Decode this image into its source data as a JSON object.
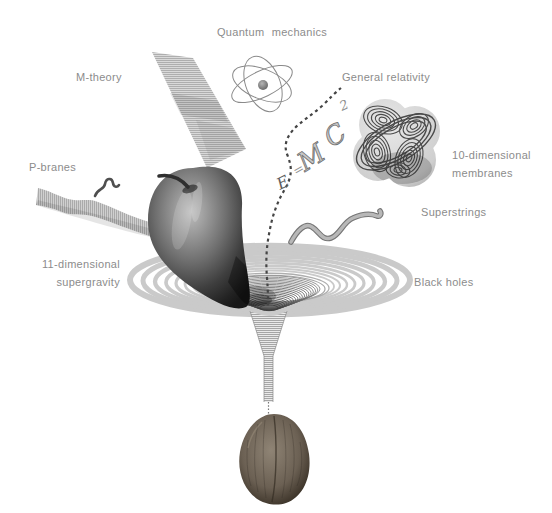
{
  "page": {
    "type": "physics-theory-illustration",
    "background": "#ffffff"
  },
  "labels": {
    "quantum_mechanics": "Quantum mechanics",
    "m_theory": "M-theory",
    "general_relativity": "General relativity",
    "membranes_line1": "10-dimensional",
    "membranes_line2": "membranes",
    "superstrings": "Superstrings",
    "p_branes": "P-branes",
    "supergravity_line1": "11-dimensional",
    "supergravity_line2": "supergravity",
    "black_holes": "Black holes"
  },
  "formula": {
    "e": "E",
    "equals": "=",
    "m": "M",
    "c": "C",
    "exponent": "2"
  },
  "colors": {
    "label_text": "#8c8c8c",
    "ring_light": "#cacaca",
    "ring_dark": "#3c3c3c",
    "apple_dark": "#181818",
    "walnut_brown": "#574d42",
    "string_gray": "#9a9a9a"
  },
  "icons": [
    "atom-icon",
    "membrane-sheet-icon",
    "rope-knot-icon",
    "superstring-icon",
    "brane-ribbon-icon",
    "worm-string-icon",
    "dashed-string-icon",
    "emc2-formula",
    "apple-icon",
    "blackhole-vortex-icon",
    "funnel-throat-icon",
    "walnut-icon"
  ]
}
